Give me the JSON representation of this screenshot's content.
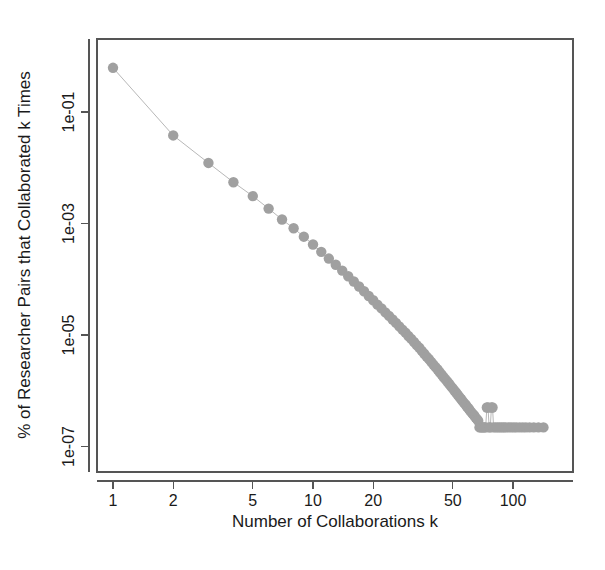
{
  "figure": {
    "background_color": "#ffffff",
    "point_color": "#a0a0a0",
    "line_color": "#b8b8b8",
    "axis_color": "#555555",
    "text_color": "#1a1a1a"
  },
  "chart_data": {
    "type": "scatter",
    "title": "",
    "subtitle": "",
    "xlabel": "Number of Collaborations k",
    "ylabel": "% of Researcher Pairs that Collaborated k Times",
    "xscale": "log",
    "yscale": "log",
    "grid": false,
    "legend": null,
    "legend_position": "none",
    "xlim": [
      0.88,
      160
    ],
    "ylim": [
      1.1e-07,
      1.6
    ],
    "xticks": [
      1,
      2,
      5,
      10,
      20,
      50,
      100
    ],
    "xticklabels": [
      "1",
      "2",
      "5",
      "10",
      "20",
      "50",
      "100"
    ],
    "yticks": [
      0.1,
      0.001,
      1e-05,
      1e-07
    ],
    "yticklabels": [
      "1e-01",
      "1e-03",
      "1e-05",
      "1e-07"
    ],
    "marker": "filled-circle",
    "connected": true,
    "series": [
      {
        "name": "collaboration frequency distribution",
        "x": [
          1,
          2,
          3,
          4,
          5,
          6,
          7,
          8,
          9,
          10,
          11,
          12,
          13,
          14,
          15,
          16,
          17,
          18,
          19,
          20,
          21,
          22,
          23,
          24,
          25,
          26,
          27,
          28,
          29,
          30,
          31,
          32,
          33,
          34,
          35,
          36,
          37,
          38,
          39,
          40,
          41,
          42,
          43,
          44,
          45,
          46,
          47,
          48,
          49,
          50,
          51,
          52,
          53,
          54,
          55,
          56,
          57,
          58,
          59,
          60,
          61,
          62,
          63,
          64,
          65,
          66,
          67,
          68,
          69,
          70,
          71,
          72,
          73,
          74,
          75,
          76,
          77,
          78,
          79,
          80,
          82,
          84,
          86,
          88,
          90,
          92,
          95,
          98,
          101,
          104,
          108,
          112,
          116,
          121,
          127,
          134,
          142
        ],
        "y": [
          0.62,
          0.038,
          0.0122,
          0.0055,
          0.0031,
          0.00185,
          0.00118,
          0.00082,
          0.00058,
          0.00042,
          0.00031,
          0.000235,
          0.000182,
          0.000143,
          0.000113,
          9.1e-05,
          7.4e-05,
          6.1e-05,
          5e-05,
          4.2e-05,
          3.5e-05,
          3e-05,
          2.55e-05,
          2.2e-05,
          1.9e-05,
          1.65e-05,
          1.43e-05,
          1.25e-05,
          1.1e-05,
          9.6e-06,
          8.5e-06,
          7.5e-06,
          6.6e-06,
          5.9e-06,
          5.2e-06,
          4.6e-06,
          4.1e-06,
          3.7e-06,
          3.3e-06,
          2.95e-06,
          2.65e-06,
          2.4e-06,
          2.15e-06,
          1.95e-06,
          1.75e-06,
          1.6e-06,
          1.45e-06,
          1.32e-06,
          1.2e-06,
          1.1e-06,
          1e-06,
          9.2e-07,
          8.4e-07,
          7.7e-07,
          7.1e-07,
          6.5e-07,
          6e-07,
          5.6e-07,
          5.1e-07,
          4.8e-07,
          4.4e-07,
          4.1e-07,
          3.8e-07,
          3.6e-07,
          3.3e-07,
          3.1e-07,
          2.9e-07,
          2.2e-07,
          2.2e-07,
          2.2e-07,
          2.2e-07,
          2.2e-07,
          2.2e-07,
          5e-07,
          5e-07,
          2.2e-07,
          2.2e-07,
          5e-07,
          5e-07,
          2.2e-07,
          2.2e-07,
          2.2e-07,
          2.2e-07,
          2.2e-07,
          2.2e-07,
          2.2e-07,
          2.2e-07,
          2.2e-07,
          2.2e-07,
          2.2e-07,
          2.2e-07,
          2.2e-07,
          2.2e-07,
          2.2e-07,
          2.2e-07,
          2.2e-07,
          2.2e-07
        ],
        "color": "#a0a0a0"
      }
    ]
  }
}
